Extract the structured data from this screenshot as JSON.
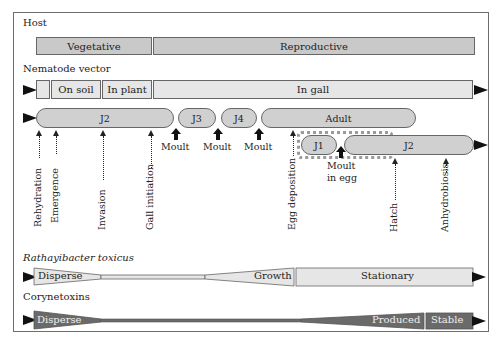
{
  "diagram": {
    "host": {
      "title": "Host",
      "phases": [
        {
          "label": "Vegetative"
        },
        {
          "label": "Reproductive"
        }
      ]
    },
    "nematode_vector": {
      "title": "Nematode vector",
      "habitat": [
        {
          "label": ""
        },
        {
          "label": "On soil"
        },
        {
          "label": "In plant"
        },
        {
          "label": "In gall"
        }
      ],
      "stages": [
        {
          "label": "J2"
        },
        {
          "label": "J3"
        },
        {
          "label": "J4"
        },
        {
          "label": "Adult"
        },
        {
          "label": "J1"
        },
        {
          "label": "J2"
        }
      ],
      "moults": [
        {
          "label": "Moult"
        },
        {
          "label": "Moult"
        },
        {
          "label": "Moult"
        },
        {
          "label": "Moult\nin egg",
          "line1": "Moult",
          "line2": "in egg"
        }
      ],
      "events": [
        {
          "label": "Rehydration"
        },
        {
          "label": "Emergence"
        },
        {
          "label": "Invasion"
        },
        {
          "label": "Gall initiation"
        },
        {
          "label": "Egg deposition"
        },
        {
          "label": "Hatch"
        },
        {
          "label": "Anhydrobiosis"
        }
      ]
    },
    "bacterium": {
      "title": "Rathayibacter toxicus",
      "phases": [
        {
          "label": "Disperse"
        },
        {
          "label": "Growth"
        },
        {
          "label": "Stationary"
        }
      ]
    },
    "toxins": {
      "title": "Corynetoxins",
      "phases": [
        {
          "label": "Disperse"
        },
        {
          "label": "Produced"
        },
        {
          "label": "Stable"
        }
      ]
    }
  },
  "colors": {
    "bar_dark": "#c9c9c9",
    "bar_light": "#e6e6e6",
    "toxin_fill": "#6a6a6a",
    "border": "#666666",
    "arrow": "#111111"
  }
}
